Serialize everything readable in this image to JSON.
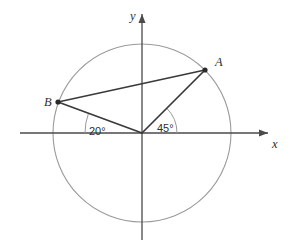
{
  "figure": {
    "background_color": "#ffffff",
    "axes": {
      "x_label": "x",
      "y_label": "y",
      "axis_color": "#4a4a4a",
      "origin": {
        "x": 142,
        "y": 133
      }
    },
    "circle": {
      "center_x": 142,
      "center_y": 133,
      "radius": 89,
      "stroke_color": "#9a9a9a"
    },
    "points": [
      {
        "label": "A",
        "x": 205,
        "y": 70,
        "angle_deg": 45,
        "label_offset_x": 10,
        "label_offset_y": -6
      },
      {
        "label": "B",
        "x": 58,
        "y": 102,
        "angle_deg": 160,
        "label_offset_x": -14,
        "label_offset_y": 0
      }
    ],
    "angles": [
      {
        "label": "45°",
        "value": 45,
        "unit": "degrees",
        "arc_radius": 35,
        "label_x": 157,
        "label_y": 128,
        "from_deg": 0,
        "to_deg": 45
      },
      {
        "label": "20°",
        "value": 20,
        "unit": "degrees",
        "arc_radius": 57,
        "label_x": 90,
        "label_y": 131,
        "from_deg": 160,
        "to_deg": 180
      }
    ],
    "segments": [
      {
        "name": "origin-to-A",
        "from": "origin",
        "to": "A"
      },
      {
        "name": "origin-to-B",
        "from": "origin",
        "to": "B"
      },
      {
        "name": "A-to-B",
        "from": "A",
        "to": "B"
      }
    ],
    "line_color": "#3a3a3a"
  }
}
